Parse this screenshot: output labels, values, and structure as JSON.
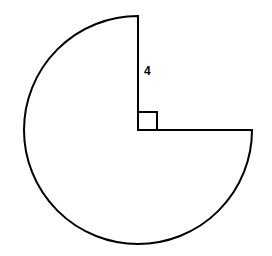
{
  "figure": {
    "shape": "three-quarter circle (sector of 270 degrees)",
    "radius_label": "4",
    "right_angle_marker": true,
    "stroke_color": "#000000",
    "background": "#ffffff"
  }
}
